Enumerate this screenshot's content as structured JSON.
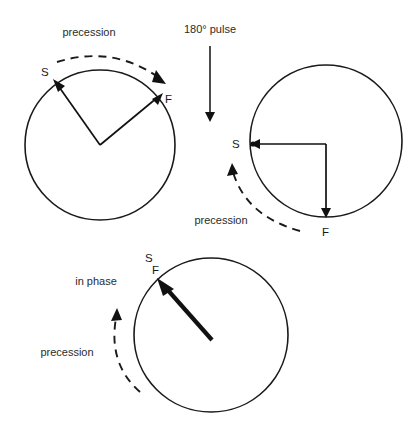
{
  "figure": {
    "background_color": "#ffffff",
    "stroke_color": "#1a1a1a",
    "text_color": "#2b2b2b",
    "width": 419,
    "height": 430
  },
  "labels": {
    "precession_top": "precession",
    "pulse": "180° pulse",
    "precession_middle": "precession",
    "in_phase": "in phase",
    "precession_bottom": "precession"
  },
  "panels": [
    {
      "id": "dephasing",
      "name": "dephasing-circle",
      "center": [
        100,
        145
      ],
      "radius": 75,
      "precession_label": "precession",
      "precession_direction": "clockwise",
      "vectors": [
        {
          "name": "slow",
          "label": "S",
          "angle_deg": 135,
          "label_pos": [
            41,
            76
          ]
        },
        {
          "name": "fast",
          "label": "F",
          "angle_deg": 40,
          "label_pos": [
            165,
            103
          ]
        }
      ]
    },
    {
      "id": "after-pulse",
      "name": "after-pulse-circle",
      "center": [
        326,
        141
      ],
      "radius": 76,
      "precession_label": "precession",
      "precession_direction": "counter-clockwise",
      "vectors": [
        {
          "name": "slow",
          "label": "S",
          "angle_deg": 180,
          "label_pos": [
            238,
            148
          ]
        },
        {
          "name": "fast",
          "label": "F",
          "angle_deg": 270,
          "label_pos": [
            321,
            234
          ]
        }
      ]
    },
    {
      "id": "rephased",
      "name": "rephased-circle",
      "center": [
        211,
        335
      ],
      "radius": 77,
      "precession_label": "precession",
      "in_phase_label": "in phase",
      "precession_direction": "counter-clockwise",
      "vectors": [
        {
          "name": "slow-fast-merged",
          "label": "S",
          "angle_deg": 135,
          "label_pos": [
            149,
            262
          ]
        },
        {
          "name": "fast",
          "label": "F",
          "angle_deg": 135,
          "label_pos": [
            155,
            273
          ]
        }
      ]
    }
  ],
  "pulse_arrow": {
    "label": "180° pulse",
    "from": [
      210,
      48
    ],
    "to": [
      210,
      120
    ],
    "direction": "down"
  }
}
